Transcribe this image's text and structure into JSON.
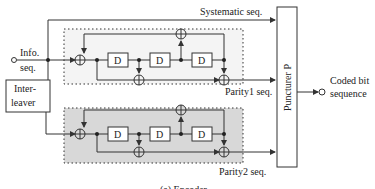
{
  "labels": {
    "info": "Info.",
    "seq": "seq.",
    "interleaver_1": "Inter-",
    "interleaver_2": "leaver",
    "systematic": "Systematic seq.",
    "parity1": "Parity1 seq.",
    "parity2": "Parity2 seq.",
    "puncturer": "Puncturer P",
    "coded_1": "Coded bit",
    "coded_2": "sequence",
    "delay": "D",
    "caption": "(a) Encoder"
  },
  "colors": {
    "line": "#333333",
    "shade": "#d8d8d8",
    "top_box_fill": "#f4f4f4"
  }
}
